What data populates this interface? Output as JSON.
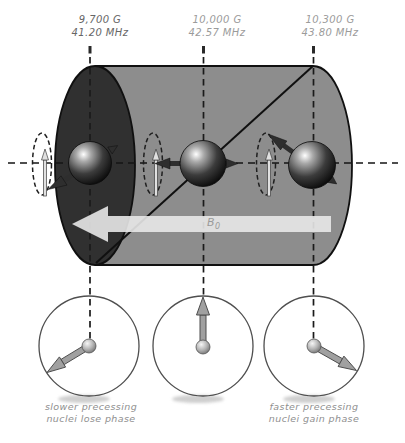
{
  "labels": {
    "columns": [
      {
        "gauss": "9,700 G",
        "freq": "41.20 MHz"
      },
      {
        "gauss": "10,000 G",
        "freq": "42.57 MHz"
      },
      {
        "gauss": "10,300 G",
        "freq": "43.80 MHz"
      }
    ],
    "b0": {
      "main": "B",
      "sub": "0"
    },
    "captions": {
      "left": {
        "line1": "slower precessing",
        "line2": "nuclei lose phase"
      },
      "right": {
        "line1": "faster precessing",
        "line2": "nuclei gain phase"
      }
    }
  },
  "colors": {
    "cylinder_body": "#8d8d8d",
    "cylinder_left_cap": "#303030",
    "outline": "#101010",
    "b0_arrow": "#e8e8e8",
    "label_dark": "#666666",
    "label_light": "#9b9b9b",
    "caption_text": "#8f8f8f",
    "phase_arrow": "#a0a0a0"
  }
}
